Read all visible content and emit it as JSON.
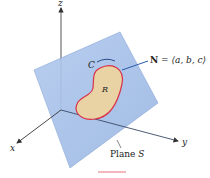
{
  "diagram": {
    "axes": {
      "x_label": "x",
      "y_label": "y",
      "z_label": "z"
    },
    "plane": {
      "label": "Plane ",
      "symbol": "S",
      "color": "#a9c3ea"
    },
    "region": {
      "symbol": "R",
      "fill_color": "#e9d3a4",
      "boundary_color": "#d9334a"
    },
    "curve": {
      "symbol": "C"
    },
    "normal": {
      "symbol": "N",
      "equals": " = ",
      "vector": "⟨a, b, c⟩",
      "color": "#2b5aa8"
    }
  }
}
